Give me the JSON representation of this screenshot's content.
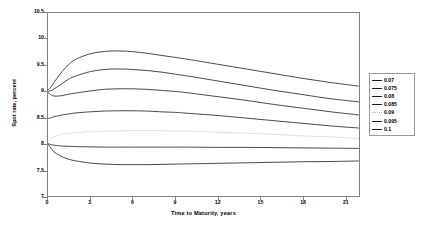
{
  "chart_data": {
    "type": "line",
    "title": "",
    "xlabel": "Time to Maturity,  years",
    "ylabel": "Spot rate, percent",
    "xlim": [
      0,
      22
    ],
    "ylim": [
      7,
      10.5
    ],
    "grid": false,
    "legend_position": "right",
    "xticks": [
      "0",
      "3",
      "6",
      "9",
      "12",
      "15",
      "18",
      "21"
    ],
    "xtick_values": [
      0,
      3,
      6,
      9,
      12,
      15,
      18,
      21
    ],
    "yticks": [
      "7",
      "7.5",
      "8",
      "8.5",
      "9",
      "9.5",
      "10",
      "10.5"
    ],
    "ytick_values": [
      7,
      7.5,
      8,
      8.5,
      9,
      9.5,
      10,
      10.5
    ],
    "x": [
      0,
      0.25,
      0.5,
      1,
      1.5,
      2,
      3,
      4,
      5,
      6,
      7,
      8,
      9,
      10,
      12,
      14,
      16,
      18,
      20,
      22
    ],
    "series": [
      {
        "name": "0.07",
        "style": "solid",
        "color": "#1a1a1a",
        "values": [
          9.02,
          9.1,
          9.2,
          9.38,
          9.52,
          9.62,
          9.72,
          9.765,
          9.775,
          9.76,
          9.73,
          9.69,
          9.65,
          9.61,
          9.52,
          9.43,
          9.34,
          9.25,
          9.17,
          9.1
        ]
      },
      {
        "name": "0.075",
        "style": "solid",
        "color": "#1a1a1a",
        "values": [
          9.0,
          9.02,
          9.06,
          9.15,
          9.24,
          9.3,
          9.38,
          9.42,
          9.43,
          9.42,
          9.4,
          9.37,
          9.33,
          9.29,
          9.2,
          9.11,
          9.02,
          8.94,
          8.86,
          8.8
        ]
      },
      {
        "name": "0.08",
        "style": "solid",
        "color": "#1a1a1a",
        "values": [
          8.98,
          8.93,
          8.91,
          8.92,
          8.95,
          8.97,
          9.01,
          9.04,
          9.05,
          9.05,
          9.04,
          9.02,
          9.0,
          8.97,
          8.9,
          8.83,
          8.75,
          8.68,
          8.61,
          8.55
        ]
      },
      {
        "name": "0.085",
        "style": "solid",
        "color": "#1a1a1a",
        "values": [
          8.48,
          8.5,
          8.52,
          8.55,
          8.57,
          8.59,
          8.61,
          8.625,
          8.63,
          8.63,
          8.625,
          8.61,
          8.6,
          8.58,
          8.54,
          8.49,
          8.44,
          8.39,
          8.34,
          8.3
        ]
      },
      {
        "name": "0.09",
        "style": "dotted",
        "color": "#b0b0b0",
        "values": [
          8.02,
          8.1,
          8.14,
          8.18,
          8.2,
          8.21,
          8.23,
          8.24,
          8.245,
          8.25,
          8.25,
          8.25,
          8.24,
          8.24,
          8.22,
          8.2,
          8.18,
          8.15,
          8.13,
          8.1
        ]
      },
      {
        "name": "0.095",
        "style": "solid",
        "color": "#1a1a1a",
        "values": [
          8.0,
          7.98,
          7.97,
          7.955,
          7.95,
          7.945,
          7.94,
          7.935,
          7.935,
          7.935,
          7.935,
          7.935,
          7.935,
          7.935,
          7.93,
          7.93,
          7.925,
          7.92,
          7.915,
          7.91
        ]
      },
      {
        "name": "0.1",
        "style": "solid",
        "color": "#1a1a1a",
        "values": [
          7.99,
          7.9,
          7.83,
          7.75,
          7.7,
          7.67,
          7.63,
          7.61,
          7.6,
          7.6,
          7.6,
          7.605,
          7.61,
          7.615,
          7.625,
          7.635,
          7.645,
          7.655,
          7.66,
          7.67
        ]
      }
    ]
  },
  "legend": {
    "entries": [
      {
        "label": "0.07"
      },
      {
        "label": "0.075"
      },
      {
        "label": "0.08"
      },
      {
        "label": "0.085"
      },
      {
        "label": "0.09"
      },
      {
        "label": "0.095"
      },
      {
        "label": "0.1"
      }
    ]
  }
}
